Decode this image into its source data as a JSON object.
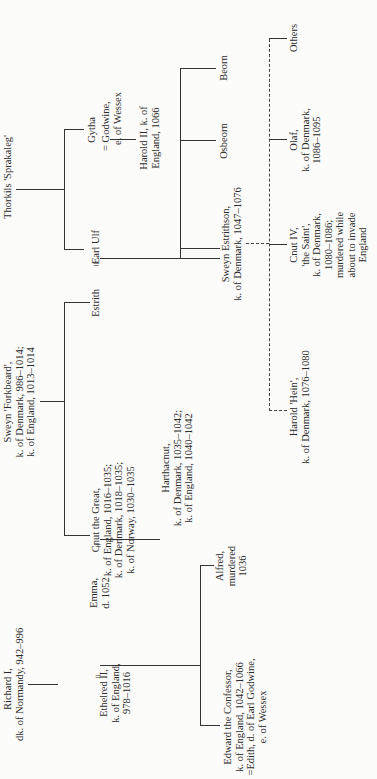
{
  "chart_title": "Genealogy of the Danish and English royal houses (rotated family tree)",
  "people": {
    "thorkils": {
      "lines": [
        "Thorkils 'Sprakaleg'"
      ]
    },
    "sweyn_forkbeard": {
      "lines": [
        "Sweyn 'Forkbeard',",
        "k. of Denmark, 986–1014;",
        "k. of England, 1013–1014"
      ]
    },
    "richard": {
      "lines": [
        "Richard I,",
        "dk. of Normandy, 942–996"
      ]
    },
    "ethelred": {
      "lines": [
        "Ethelred II,",
        "k. of England,",
        "978–1016"
      ]
    },
    "emma": {
      "lines": [
        "Emma,",
        "d. 1052"
      ]
    },
    "cnut": {
      "lines": [
        "Cnut the Great,",
        "k. of England, 1016–1035;",
        "k. of Denmark, 1018–1035;",
        "k. of Norway, 1030–1035"
      ]
    },
    "estrith": {
      "lines": [
        "Estrith"
      ]
    },
    "earl_ulf": {
      "lines": [
        "Earl Ulf"
      ]
    },
    "gytha": {
      "lines": [
        "Gytha"
      ]
    },
    "godwine": {
      "lines": [
        "= Godwine,",
        "e. of Wessex"
      ]
    },
    "harold2": {
      "lines": [
        "Harold II, k. of",
        "England, 1066"
      ]
    },
    "edward": {
      "lines": [
        "Edward the Confessor,",
        "k. of England, 1042–1066",
        "=Edith, d. of Earl Godwine,",
        "e. of Wessex"
      ]
    },
    "alfred": {
      "lines": [
        "Alfred,",
        "murdered",
        "1036"
      ]
    },
    "harthacnut": {
      "lines": [
        "Harthacnut,",
        "k. of Denmark, 1035–1042;",
        "k. of England, 1040–1042"
      ]
    },
    "sweyn_estrithson": {
      "lines": [
        "Sweyn Estrithson,",
        "k. of Denmark, 1047–1076"
      ]
    },
    "osbeorn": {
      "lines": [
        "Osbeorn"
      ]
    },
    "beorn": {
      "lines": [
        "Beorn"
      ]
    },
    "harold_hein": {
      "lines": [
        "Harold 'Hein',",
        "k. of Denmark, 1076–1080"
      ]
    },
    "cnut4": {
      "lines": [
        "Cnut IV,",
        "'the Saint',",
        "k. of Denmark,",
        "1080–1086;",
        "murdered while",
        "about to invade",
        "England"
      ]
    },
    "olaf": {
      "lines": [
        "Olaf,",
        "k. of Denmark,",
        "1086–1095"
      ]
    },
    "others": {
      "lines": [
        "Others"
      ]
    }
  },
  "marriage_sign": "="
}
